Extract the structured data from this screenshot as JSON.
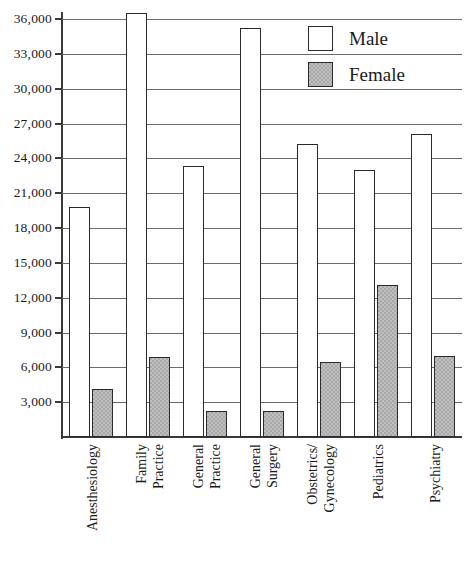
{
  "chart_data": {
    "type": "bar",
    "title": "",
    "subtitle": "",
    "xlabel": "",
    "ylabel": "",
    "ylim": [
      0,
      36000
    ],
    "ytick_values": [
      3000,
      6000,
      9000,
      12000,
      15000,
      18000,
      21000,
      24000,
      27000,
      30000,
      33000,
      36000
    ],
    "ytick_labels": [
      "3,000",
      "6,000",
      "9,000",
      "12,000",
      "15,000",
      "18,000",
      "21,000",
      "24,000",
      "27,000",
      "30,000",
      "33,000",
      "36,000"
    ],
    "grid": true,
    "grid_axis": "y",
    "legend_position": "top-right",
    "categories": [
      "Anesthesiology",
      "Family Practice",
      "General Practice",
      "General Surgery",
      "Obstetrics/ Gynecology",
      "Pediatrics",
      "Psychiatry"
    ],
    "category_lines": [
      [
        "Anesthesiology"
      ],
      [
        "Family",
        "Practice"
      ],
      [
        "General",
        "Practice"
      ],
      [
        "General",
        "Surgery"
      ],
      [
        "Obstetrics/",
        "Gynecology"
      ],
      [
        "Pediatrics"
      ],
      [
        "Psychiatry"
      ]
    ],
    "series": [
      {
        "name": "Male",
        "color": "#ffffff",
        "values": [
          19800,
          36500,
          23300,
          35200,
          25200,
          23000,
          26100
        ]
      },
      {
        "name": "Female",
        "color": "#a8a8a8",
        "values": [
          4100,
          6900,
          2200,
          2200,
          6500,
          13100,
          7000
        ]
      }
    ]
  },
  "legend": {
    "items": [
      {
        "label": "Male",
        "swatch": "white-square"
      },
      {
        "label": "Female",
        "swatch": "gray-square"
      }
    ]
  },
  "colors": {
    "male_fill": "#ffffff",
    "female_fill": "#a8a8a8",
    "bar_stroke": "#2b2b2b",
    "gridline": "#6b6b6b",
    "axis": "#3a3a3a",
    "text": "#1a1a1a",
    "background": "#ffffff"
  }
}
